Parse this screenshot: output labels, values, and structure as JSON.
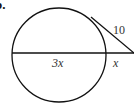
{
  "problem": {
    "number_label": "b.",
    "labels": {
      "tangent": "10",
      "internal_chord_segment": "3x",
      "external_segment": "x"
    },
    "colors": {
      "stroke": "#111111",
      "text": "#333333"
    }
  }
}
